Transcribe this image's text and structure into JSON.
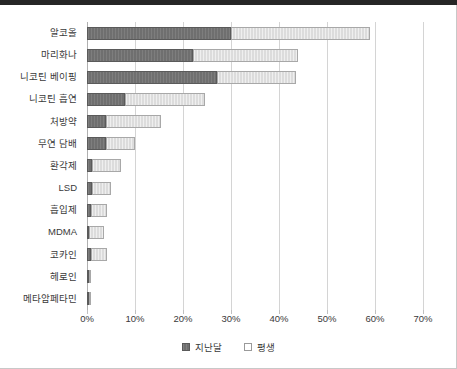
{
  "chart_data": {
    "type": "bar",
    "orientation": "horizontal",
    "stacked": true,
    "title": "",
    "xlabel": "",
    "ylabel": "",
    "xlim": [
      0,
      70
    ],
    "xticks": [
      0,
      10,
      20,
      30,
      40,
      50,
      60,
      70
    ],
    "xtick_labels": [
      "0%",
      "10%",
      "20%",
      "30%",
      "40%",
      "50%",
      "60%",
      "70%"
    ],
    "grid": true,
    "grid_axis": "x",
    "legend_position": "bottom",
    "categories": [
      "알코올",
      "마리화나",
      "니코틴 베이핑",
      "니코틴 흡연",
      "처방약",
      "무연 담배",
      "환각제",
      "LSD",
      "흡입제",
      "MDMA",
      "코카인",
      "헤로인",
      "메타암페타민"
    ],
    "series": [
      {
        "name": "지난달",
        "color": "#6f6f6f",
        "values": [
          30.0,
          22.0,
          27.0,
          8.0,
          4.0,
          4.0,
          1.0,
          1.0,
          0.8,
          0.5,
          0.8,
          0.4,
          0.4
        ]
      },
      {
        "name": "평생",
        "color": "#dcdcdc",
        "values": [
          29.0,
          22.0,
          16.5,
          16.5,
          11.5,
          6.0,
          6.0,
          4.0,
          3.4,
          3.1,
          3.3,
          0.4,
          0.3
        ]
      }
    ],
    "totals": [
      59.0,
      44.0,
      43.5,
      24.5,
      15.5,
      10.0,
      7.0,
      5.0,
      4.2,
      3.6,
      4.1,
      0.8,
      0.7
    ]
  },
  "legend": {
    "items": [
      {
        "label": "지난달",
        "swatch": "dark-gray-swatch"
      },
      {
        "label": "평생",
        "swatch": "light-gray-swatch"
      }
    ]
  }
}
